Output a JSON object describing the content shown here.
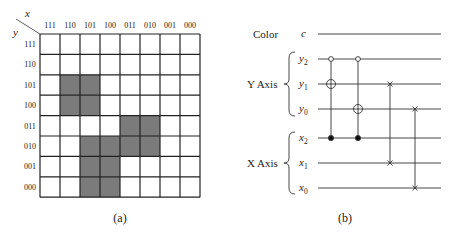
{
  "panel_a": {
    "caption": "(a)",
    "x_axis_label": "x",
    "y_axis_label": "y",
    "columns": [
      "111",
      "110",
      "101",
      "100",
      "011",
      "010",
      "001",
      "000"
    ],
    "rows": [
      "111",
      "110",
      "101",
      "100",
      "011",
      "010",
      "001",
      "000"
    ],
    "shaded_color": "#7b7b7b",
    "shaded_cells": [
      {
        "row": "101",
        "col": "110"
      },
      {
        "row": "101",
        "col": "101"
      },
      {
        "row": "100",
        "col": "110"
      },
      {
        "row": "100",
        "col": "101"
      },
      {
        "row": "011",
        "col": "011"
      },
      {
        "row": "011",
        "col": "010"
      },
      {
        "row": "010",
        "col": "101"
      },
      {
        "row": "010",
        "col": "100"
      },
      {
        "row": "010",
        "col": "011"
      },
      {
        "row": "010",
        "col": "010"
      },
      {
        "row": "001",
        "col": "101"
      },
      {
        "row": "001",
        "col": "100"
      },
      {
        "row": "000",
        "col": "101"
      },
      {
        "row": "000",
        "col": "100"
      }
    ]
  },
  "panel_b": {
    "caption": "(b)",
    "color_group_label": "Color",
    "y_group_label": "Y Axis",
    "x_group_label": "X Axis",
    "wires": [
      {
        "id": "c",
        "label": "c",
        "sub": ""
      },
      {
        "id": "y2",
        "label": "y",
        "sub": "2"
      },
      {
        "id": "y1",
        "label": "y",
        "sub": "1"
      },
      {
        "id": "y0",
        "label": "y",
        "sub": "0"
      },
      {
        "id": "x2",
        "label": "x",
        "sub": "2"
      },
      {
        "id": "x1",
        "label": "x",
        "sub": "1"
      },
      {
        "id": "x0",
        "label": "x",
        "sub": "0"
      }
    ],
    "gates": [
      {
        "type": "controlled-not",
        "column": 1,
        "controls": [
          {
            "wire": "y2",
            "kind": "open"
          },
          {
            "wire": "x2",
            "kind": "filled"
          }
        ],
        "target": "y1"
      },
      {
        "type": "controlled-not",
        "column": 2,
        "controls": [
          {
            "wire": "y2",
            "kind": "open"
          },
          {
            "wire": "x2",
            "kind": "filled"
          }
        ],
        "target": "y0"
      },
      {
        "type": "swap",
        "column": 3,
        "wires": [
          "y1",
          "x1"
        ]
      },
      {
        "type": "swap",
        "column": 4,
        "wires": [
          "y0",
          "x0"
        ]
      }
    ]
  }
}
